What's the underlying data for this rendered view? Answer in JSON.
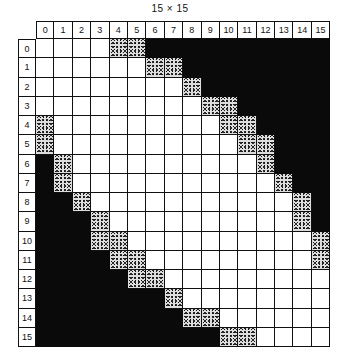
{
  "title": "15 × 15",
  "columns": [
    "0",
    "1",
    "2",
    "3",
    "4",
    "5",
    "6",
    "7",
    "8",
    "9",
    "10",
    "11",
    "12",
    "13",
    "14",
    "15"
  ],
  "rows": [
    "0",
    "1",
    "2",
    "3",
    "4",
    "5",
    "6",
    "7",
    "8",
    "9",
    "10",
    "11",
    "12",
    "13",
    "14",
    "15"
  ],
  "legend": {
    "w": "white cell",
    "s": "stippled cell",
    "b": "black cell"
  },
  "cells": [
    "wwwwssbbbbbbbbbb",
    "wwwwwwssbbbbbbbb",
    "wwwwwwwwsbbbbbbb",
    "wwwwwwwwwssbbbbb",
    "swwwwwwwwwssbbbb",
    "swwwwwwwwwwssbbb",
    "bswwwwwwwwwwsbbb",
    "bswwwwwwwwwwwsbb",
    "bbswwwwwwwwwwwsb",
    "bbbswwwwwwwwwwsb",
    "bbbsswwwwwwwwwws",
    "bbbbsswwwwwwwwws",
    "bbbbbsswwwwwwwww",
    "bbbbbbbswwwwwwww",
    "bbbbbbbbsswwwwww",
    "bbbbbbbbbbsswwww"
  ]
}
